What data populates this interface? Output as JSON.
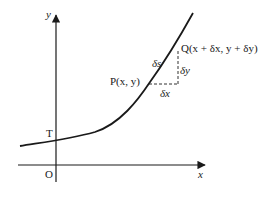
{
  "diagram": {
    "axes": {
      "x_label": "x",
      "y_label": "y",
      "origin_label": "O"
    },
    "points": {
      "T": {
        "label": "T"
      },
      "P": {
        "label": "P(x, y)",
        "name": "P",
        "coords": "(x, y)"
      },
      "Q": {
        "label": "Q(x + δx, y + δy)",
        "name": "Q",
        "coords": "(x + δx, y + δy)"
      }
    },
    "increments": {
      "arc": "δs",
      "dx": "δx",
      "dy": "δy"
    },
    "colors": {
      "stroke": "#1a1a1a",
      "background": "#ffffff"
    }
  }
}
